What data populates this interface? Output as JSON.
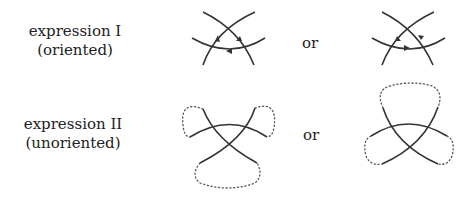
{
  "rows": [
    {
      "line1": "expression I",
      "line2": "(oriented)"
    },
    {
      "line1": "expression II",
      "line2": "(unoriented)"
    }
  ],
  "separators": [
    "or",
    "or"
  ]
}
